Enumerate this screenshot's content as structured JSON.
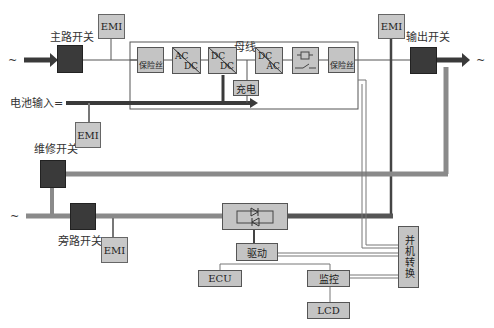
{
  "diagram": {
    "type": "UPS system block diagram",
    "input_symbol": "~",
    "output_symbol": "~",
    "bypass_input_symbol": "~",
    "labels": {
      "main_switch": "主路开关",
      "output_switch": "输出开关",
      "battery_input": "电池输入=",
      "maintenance_switch": "维修开关",
      "bypass_switch": "旁路开关",
      "bus": "母线"
    },
    "emi_filters": [
      "EMI",
      "EMI",
      "EMI",
      "EMI"
    ],
    "main_path_blocks": [
      {
        "id": "fuse-in",
        "label": "保险丝"
      },
      {
        "id": "rectifier",
        "top": "AC",
        "bottom": "DC"
      },
      {
        "id": "dcdc",
        "top": "DC",
        "bottom": "DC"
      },
      {
        "id": "inverter",
        "top": "DC",
        "bottom": "AC"
      },
      {
        "id": "relay",
        "label": ""
      },
      {
        "id": "fuse-out",
        "label": "保险丝"
      }
    ],
    "charger": "充电",
    "control_blocks": {
      "driver": "驱动",
      "ecu": "ECU",
      "monitor": "监控",
      "lcd": "LCD",
      "parallel": "并机转换"
    },
    "colors": {
      "main_arrow": "#3a3a3a",
      "bypass_line": "#8a8a8a",
      "block_fill": "#c4c4c4",
      "switch_fill": "#3a3a3a"
    }
  }
}
